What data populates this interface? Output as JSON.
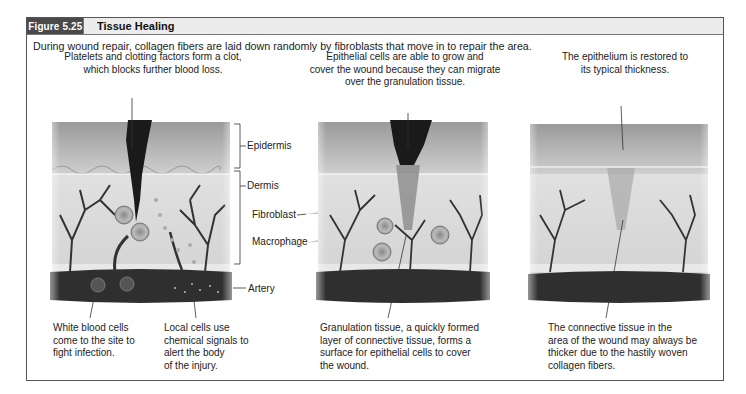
{
  "figure": {
    "number": "Figure 5.25",
    "title": "Tissue Healing",
    "intro": "During wound repair, collagen fibers are laid down randomly by fibroblasts that move in to repair the area.",
    "colors": {
      "header_dark": "#4a4a4a",
      "header_light": "#ececec",
      "border": "#555555"
    }
  },
  "panels": [
    {
      "id": "clot",
      "top_caption_lines": [
        "Platelets and clotting factors form a clot,",
        "which blocks further blood loss."
      ],
      "bottom_captions": [
        {
          "lines": [
            "White blood cells",
            "come to the site to",
            "fight infection."
          ]
        },
        {
          "lines": [
            "Local cells use",
            "chemical signals to",
            "alert the body",
            "of the injury."
          ]
        }
      ]
    },
    {
      "id": "granulation",
      "top_caption_lines": [
        "Epithelial cells are able to grow and",
        "cover the wound because they can migrate",
        "over the granulation tissue."
      ],
      "bottom_captions": [
        {
          "lines": [
            "Granulation tissue, a quickly formed",
            "layer of connective tissue, forms a",
            "surface for epithelial cells to cover",
            "the wound."
          ]
        }
      ]
    },
    {
      "id": "restored",
      "top_caption_lines": [
        "The epithelium is restored to",
        "its typical thickness."
      ],
      "bottom_captions": [
        {
          "lines": [
            "The connective tissue in the",
            "area of the wound may always be",
            "thicker due to the hastily woven",
            "collagen fibers."
          ]
        }
      ]
    }
  ],
  "labels": {
    "epidermis": "Epidermis",
    "dermis": "Dermis",
    "fibroblast": "Fibroblast",
    "macrophage": "Macrophage",
    "artery": "Artery"
  }
}
